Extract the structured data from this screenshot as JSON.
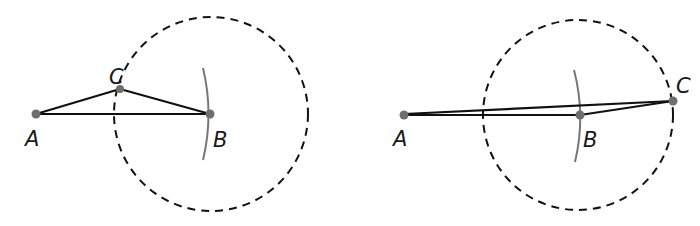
{
  "figures": [
    {
      "id": "left",
      "labels": {
        "A": "A",
        "B": "B",
        "C": "C"
      },
      "points": {
        "A": [
          36,
          114
        ],
        "B": [
          210,
          114
        ],
        "C": [
          120,
          89
        ]
      },
      "circle": {
        "cx": 211,
        "cy": 114,
        "r": 97
      },
      "arc": {
        "x": 207,
        "y_top": 68,
        "y_bottom": 160
      }
    },
    {
      "id": "right",
      "labels": {
        "A": "A",
        "B": "B",
        "C": "C"
      },
      "points": {
        "A": [
          404,
          115
        ],
        "B": [
          580,
          115
        ],
        "C": [
          673,
          101
        ]
      },
      "circle": {
        "cx": 578,
        "cy": 115,
        "r": 95
      },
      "arc": {
        "x": 578,
        "y_top": 70,
        "y_bottom": 162
      }
    }
  ],
  "colors": {
    "line": "#111111",
    "point": "#6e6e6e",
    "arc": "#777777",
    "circle": "#111111"
  }
}
